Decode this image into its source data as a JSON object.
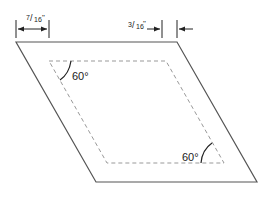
{
  "diagram": {
    "dimensions": {
      "left_width": {
        "numerator": "7",
        "denominator": "16",
        "unit": "\""
      },
      "right_width": {
        "numerator": "3",
        "denominator": "16",
        "unit": "\""
      }
    },
    "angles": {
      "top_left": "60°",
      "bottom_right": "60°"
    },
    "colors": {
      "outline": "#555555",
      "dashed": "#999999",
      "text": "#222222"
    }
  }
}
